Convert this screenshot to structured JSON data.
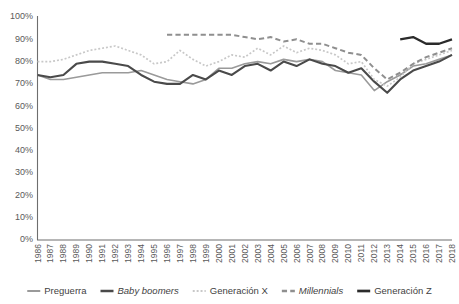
{
  "chart_data": {
    "type": "line",
    "title": "",
    "xlabel": "",
    "ylabel": "",
    "ylim": [
      0,
      100
    ],
    "ytick_labels": [
      "0%",
      "10%",
      "20%",
      "30%",
      "40%",
      "50%",
      "60%",
      "70%",
      "80%",
      "90%",
      "100%"
    ],
    "ytick_values": [
      0,
      10,
      20,
      30,
      40,
      50,
      60,
      70,
      80,
      90,
      100
    ],
    "grid": false,
    "legend_position": "bottom",
    "categories": [
      "1986",
      "1987",
      "1988",
      "1989",
      "1990",
      "1991",
      "1992",
      "1993",
      "1994",
      "1995",
      "1996",
      "1997",
      "1998",
      "1999",
      "2000",
      "2001",
      "2002",
      "2003",
      "2004",
      "2005",
      "2006",
      "2007",
      "2008",
      "2009",
      "2010",
      "2011",
      "2012",
      "2013",
      "2014",
      "2015",
      "2016",
      "2017",
      "2018"
    ],
    "series": [
      {
        "name": "Preguerra",
        "color": "#9a9a9a",
        "style": "solid",
        "width": 1.6,
        "values": [
          74,
          72,
          72,
          73,
          74,
          75,
          75,
          75,
          76,
          74,
          72,
          71,
          70,
          72,
          77,
          77,
          79,
          80,
          79,
          81,
          80,
          81,
          80,
          76,
          75,
          74,
          67,
          71,
          74,
          78,
          79,
          81,
          83
        ]
      },
      {
        "name": "Baby boomers",
        "color": "#4a4a4a",
        "style": "solid",
        "width": 2.1,
        "values": [
          74,
          73,
          74,
          79,
          80,
          80,
          79,
          78,
          74,
          71,
          70,
          70,
          74,
          72,
          76,
          74,
          78,
          79,
          76,
          80,
          78,
          81,
          79,
          78,
          75,
          77,
          71,
          66,
          72,
          76,
          78,
          80,
          83
        ]
      },
      {
        "name": "Generación X",
        "color": "#c8c8c8",
        "style": "dotted",
        "width": 1.7,
        "values": [
          80,
          80,
          81,
          83,
          85,
          86,
          87,
          85,
          83,
          79,
          80,
          85,
          81,
          78,
          80,
          83,
          82,
          86,
          83,
          87,
          84,
          86,
          85,
          83,
          79,
          80,
          72,
          69,
          73,
          79,
          81,
          83,
          85
        ]
      },
      {
        "name": "Millennials",
        "color": "#8f8f8f",
        "style": "dashed",
        "width": 2.0,
        "values": [
          null,
          null,
          null,
          null,
          null,
          null,
          null,
          null,
          null,
          null,
          92,
          92,
          92,
          92,
          92,
          92,
          91,
          90,
          91,
          89,
          90,
          88,
          88,
          86,
          84,
          83,
          77,
          72,
          75,
          79,
          82,
          84,
          86
        ]
      },
      {
        "name": "Generación Z",
        "color": "#2b2b2b",
        "style": "solid",
        "width": 2.3,
        "values": [
          null,
          null,
          null,
          null,
          null,
          null,
          null,
          null,
          null,
          null,
          null,
          null,
          null,
          null,
          null,
          null,
          null,
          null,
          null,
          null,
          null,
          null,
          null,
          null,
          null,
          null,
          null,
          null,
          90,
          91,
          88,
          88,
          90
        ]
      }
    ]
  },
  "legend": {
    "items": [
      {
        "label": "Preguerra",
        "italic": false
      },
      {
        "label": "Baby boomers",
        "italic": true
      },
      {
        "label": "Generación X",
        "italic": false
      },
      {
        "label": "Millennials",
        "italic": true
      },
      {
        "label": "Generación Z",
        "italic": false
      }
    ]
  }
}
